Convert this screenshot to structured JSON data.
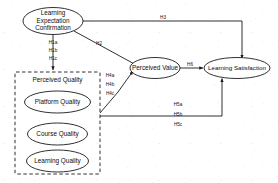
{
  "diagram": {
    "type": "structural-equation-model-path-diagram",
    "stroke_color": "#1a1a1a",
    "background_color": "#ffffff",
    "nodes": [
      {
        "id": "learning_expectation_confirmation",
        "label_lines": [
          "Learning",
          "Expectation",
          "Confirmation"
        ],
        "shape": "ellipse"
      },
      {
        "id": "perceived_value",
        "label": "Perceived Value",
        "shape": "ellipse"
      },
      {
        "id": "learning_satisfaction",
        "label": "Learning Satisfaction",
        "shape": "ellipse"
      },
      {
        "id": "platform_quality",
        "label": "Platform Quality",
        "shape": "ellipse"
      },
      {
        "id": "course_quality",
        "label": "Course Quality",
        "shape": "ellipse"
      },
      {
        "id": "learning_quality",
        "label": "Learning Quality",
        "shape": "ellipse"
      }
    ],
    "group": {
      "id": "perceived_quality_group",
      "title": "Perceived Quality",
      "border_style": "dashed",
      "members": [
        "platform_quality",
        "course_quality",
        "learning_quality"
      ]
    },
    "paths": [
      {
        "id": "h1a",
        "label": "H1a",
        "from": "learning_expectation_confirmation",
        "to": "platform_quality"
      },
      {
        "id": "h1b",
        "label": "H1b",
        "from": "learning_expectation_confirmation",
        "to": "course_quality"
      },
      {
        "id": "h1c",
        "label": "H1c",
        "from": "learning_expectation_confirmation",
        "to": "learning_quality"
      },
      {
        "id": "h2",
        "label": "H2",
        "from": "learning_expectation_confirmation",
        "to": "perceived_value"
      },
      {
        "id": "h3",
        "label": "H3",
        "from": "learning_expectation_confirmation",
        "to": "learning_satisfaction"
      },
      {
        "id": "h4a",
        "label": "H4a",
        "from": "platform_quality",
        "to": "perceived_value"
      },
      {
        "id": "h4b",
        "label": "H4b",
        "from": "course_quality",
        "to": "perceived_value"
      },
      {
        "id": "h4c",
        "label": "H4c",
        "from": "learning_quality",
        "to": "perceived_value"
      },
      {
        "id": "h5a",
        "label": "H5a",
        "from": "platform_quality",
        "to": "learning_satisfaction"
      },
      {
        "id": "h5b",
        "label": "H5b",
        "from": "course_quality",
        "to": "learning_satisfaction"
      },
      {
        "id": "h5c",
        "label": "H5c",
        "from": "learning_quality",
        "to": "learning_satisfaction"
      },
      {
        "id": "h6",
        "label": "H6",
        "from": "perceived_value",
        "to": "learning_satisfaction"
      }
    ]
  }
}
